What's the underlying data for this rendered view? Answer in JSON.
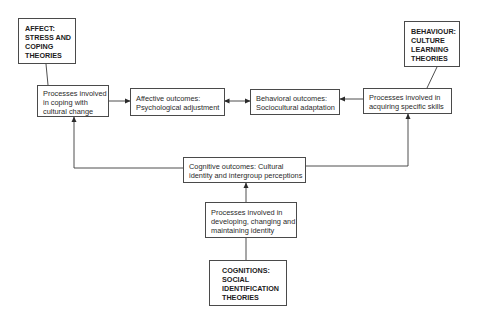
{
  "diagram": {
    "theory_boxes": {
      "affect": {
        "lines": [
          "AFFECT:",
          "STRESS AND",
          "COPING",
          "THEORIES"
        ]
      },
      "behaviour": {
        "lines": [
          "BEHAVIOUR:",
          "CULTURE",
          "LEARNING",
          "THEORIES"
        ]
      },
      "cognitions": {
        "lines": [
          "COGNITIONS:",
          "SOCIAL",
          "IDENTIFICATION",
          "THEORIES"
        ]
      }
    },
    "process_boxes": {
      "coping": {
        "lines": [
          "Processes involved",
          "in coping with",
          "cultural change"
        ]
      },
      "skills": {
        "lines": [
          "Processes involved in",
          "acquiring specific skills"
        ]
      },
      "identity": {
        "lines": [
          "Processes involved in",
          "developing, changing and",
          "maintaining identity"
        ]
      }
    },
    "outcome_boxes": {
      "affective": {
        "lines": [
          "Affective outcomes:",
          "Psychological adjustment"
        ]
      },
      "behavioral": {
        "lines": [
          "Behavioral outcomes:",
          "Sociocultural adaptation"
        ]
      },
      "cognitive": {
        "lines": [
          "Cognitive outcomes: Cultural",
          "identity and intergroup perceptions"
        ]
      }
    },
    "connections": [
      {
        "from": "affect",
        "to": "coping",
        "type": "line"
      },
      {
        "from": "behaviour",
        "to": "skills",
        "type": "line"
      },
      {
        "from": "cognitions",
        "to": "identity",
        "type": "line"
      },
      {
        "from": "coping",
        "to": "affective",
        "type": "arrow"
      },
      {
        "from": "affective",
        "to": "behavioral",
        "type": "double-arrow"
      },
      {
        "from": "skills",
        "to": "behavioral",
        "type": "arrow"
      },
      {
        "from": "identity",
        "to": "cognitive",
        "type": "arrow"
      },
      {
        "from": "cognitive",
        "to": "coping",
        "type": "arrow"
      },
      {
        "from": "cognitive",
        "to": "skills",
        "type": "arrow"
      }
    ],
    "colors": {
      "line": "#3a3a3a",
      "text": "#2a2a2a",
      "background": "#ffffff"
    }
  }
}
